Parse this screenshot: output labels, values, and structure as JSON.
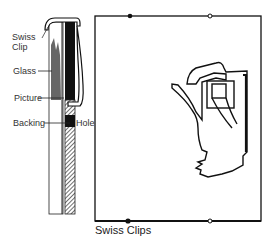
{
  "diagram": {
    "side_view": {
      "labels": {
        "swiss_clip_line1": "Swiss",
        "swiss_clip_line2": "Clip",
        "glass": "Glass",
        "picture": "Picture",
        "backing": "Backing",
        "hole": "Hole"
      }
    },
    "front_view": {
      "caption": "Swiss Clips",
      "clip_count_top": 2,
      "clip_count_bottom": 2
    }
  },
  "colors": {
    "line": "#1a1a1a",
    "background": "#ffffff"
  }
}
